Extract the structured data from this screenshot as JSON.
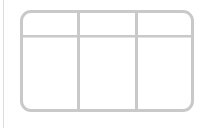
{
  "icon": {
    "name": "grid-layout-icon",
    "columns": 3,
    "rows": 2,
    "stroke_color": "#c9c9c9",
    "background_color": "#ffffff"
  },
  "left_rule": {
    "color": "#dcdcdc"
  }
}
